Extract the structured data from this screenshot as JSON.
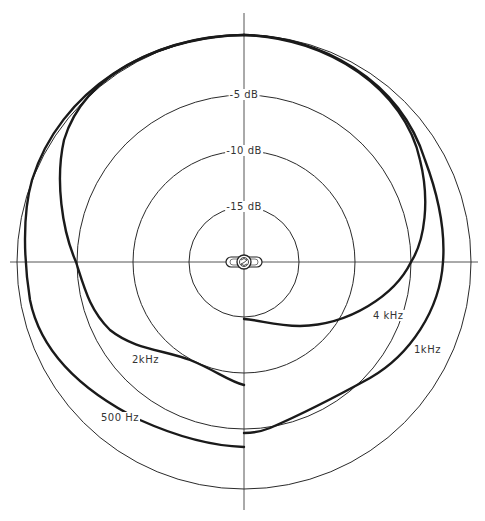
{
  "diagram": {
    "type": "polar-pattern",
    "center": [
      244,
      262
    ],
    "grid_rings": [
      {
        "label": "",
        "db": 0,
        "radius": 227
      },
      {
        "label": "-5 dB",
        "db": -5,
        "radius": 167
      },
      {
        "label": "-10 dB",
        "db": -10,
        "radius": 111
      },
      {
        "label": "-15 dB",
        "db": -15,
        "radius": 55
      }
    ],
    "curves": [
      {
        "name": "500 Hz",
        "label": "500 Hz",
        "side": "left",
        "label_pos": [
          100,
          414
        ],
        "path": "M244,35 C150,35 60,90 32,180 C22,215 24,262 30,300 C40,350 80,390 140,420 C180,438 215,446 244,447"
      },
      {
        "name": "2kHz",
        "label": "2kHz",
        "side": "left",
        "label_pos": [
          131,
          356
        ],
        "path": "M244,35 C170,36 85,70 64,140 C55,180 62,230 76,262 C85,290 90,310 110,330 C135,350 165,350 190,360 C215,370 230,382 244,385"
      },
      {
        "name": "1kHz",
        "label": "1kHz",
        "side": "right",
        "label_pos": [
          413,
          346
        ],
        "path": "M244,35 C320,36 400,80 425,160 C440,200 445,235 443,262 C440,310 410,355 370,378 C330,400 300,415 270,428 C260,432 252,433 244,433"
      },
      {
        "name": "4 kHz",
        "label": "4 kHz",
        "side": "right",
        "label_pos": [
          372,
          312
        ],
        "path": "M244,35 C330,38 405,90 420,160 C430,200 425,240 411,262 C395,295 350,325 300,326 C275,326 260,320 244,319"
      }
    ],
    "mic_icon": "microphone-capsule-icon"
  }
}
